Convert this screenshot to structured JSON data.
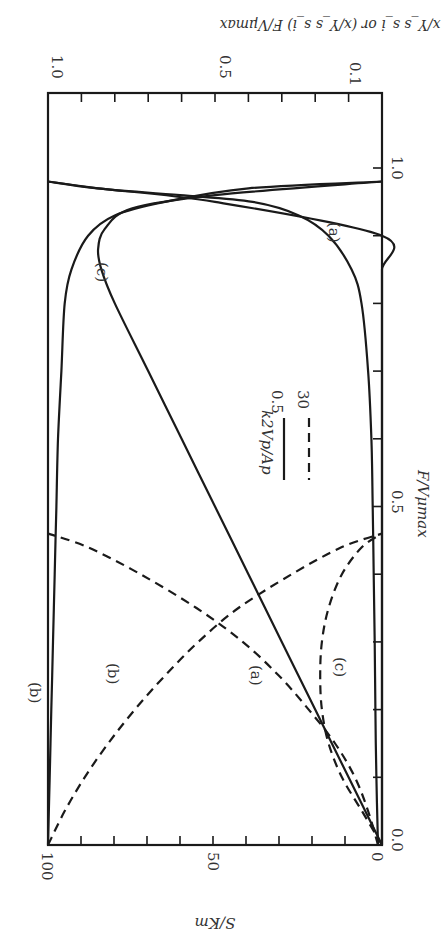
{
  "chart_data": {
    "type": "line",
    "orientation": "figure rotated 90 degrees clockwise on the page",
    "title": "",
    "xlabel": "F/Vμmax",
    "ylabel_left": "S/Km",
    "ylabel_right": "x/Y_s s_i or (x/Y_s s_i) F/Vμmax",
    "xlim": [
      0.0,
      1.0
    ],
    "ylim_left": [
      0,
      100
    ],
    "ylim_right": [
      0.0,
      1.0
    ],
    "x_ticks": [
      "0.0",
      "0.5",
      "1.0"
    ],
    "y_left_ticks": [
      "0",
      "50",
      "100"
    ],
    "y_right_ticks": [
      "0.1",
      "0.5",
      "1.0"
    ],
    "grid": false,
    "legend": {
      "title": "k2Vp/Ap",
      "entries": [
        {
          "label": "0.5",
          "style": "solid"
        },
        {
          "label": "30",
          "style": "dashed"
        }
      ]
    },
    "curve_labels": [
      "(a)",
      "(b)",
      "(c)",
      "(a)",
      "(b)",
      "(c)"
    ],
    "series": [
      {
        "name": "(a) k2Vp/Ap=0.5 — S/Km",
        "style": "solid",
        "axis": "left",
        "x": [
          0.0,
          0.1,
          0.2,
          0.3,
          0.4,
          0.5,
          0.6,
          0.7,
          0.8,
          0.85,
          0.9,
          0.93,
          0.95,
          0.96,
          0.97,
          0.98
        ],
        "y": [
          0.0,
          0.5,
          0.8,
          1.0,
          1.3,
          1.6,
          2.0,
          3.0,
          5.0,
          8.0,
          15.0,
          24.0,
          38.0,
          60.0,
          85.0,
          100.0
        ]
      },
      {
        "name": "(a) k2Vp/Ap=0.5 — biomass",
        "style": "solid",
        "axis": "right",
        "x": [
          0.0,
          0.1,
          0.2,
          0.3,
          0.4,
          0.5,
          0.6,
          0.7,
          0.8,
          0.85,
          0.9,
          0.95,
          0.97,
          0.98
        ],
        "y": [
          0.0,
          0.0,
          0.0,
          0.0,
          0.0,
          0.0,
          0.0,
          0.0,
          0.0,
          0.0,
          0.0,
          0.5,
          0.85,
          1.0
        ]
      },
      {
        "name": "(b) k2Vp/Ap=0.5 — biomass",
        "style": "solid",
        "axis": "right",
        "x": [
          0.0,
          0.1,
          0.2,
          0.3,
          0.4,
          0.5,
          0.6,
          0.7,
          0.8,
          0.85,
          0.9,
          0.93,
          0.95,
          0.97,
          0.98
        ],
        "y": [
          1.0,
          0.995,
          0.99,
          0.985,
          0.98,
          0.975,
          0.97,
          0.96,
          0.95,
          0.93,
          0.88,
          0.8,
          0.65,
          0.4,
          0.0
        ]
      },
      {
        "name": "(c) k2Vp/Ap=0.5 — product",
        "style": "solid",
        "axis": "right",
        "x": [
          0.0,
          0.1,
          0.2,
          0.3,
          0.4,
          0.5,
          0.6,
          0.7,
          0.8,
          0.85,
          0.88,
          0.91,
          0.94,
          0.96,
          0.98
        ],
        "y": [
          0.0,
          0.1,
          0.2,
          0.3,
          0.4,
          0.5,
          0.6,
          0.7,
          0.8,
          0.84,
          0.85,
          0.83,
          0.75,
          0.5,
          0.0
        ]
      },
      {
        "name": "(a) k2Vp/Ap=30 — S/Km",
        "style": "dashed",
        "axis": "left",
        "x": [
          0.0,
          0.05,
          0.1,
          0.15,
          0.2,
          0.25,
          0.3,
          0.35,
          0.4,
          0.44,
          0.46
        ],
        "y": [
          0.0,
          3.0,
          7.0,
          13.0,
          21.0,
          30.0,
          41.0,
          55.0,
          72.0,
          88.0,
          100.0
        ]
      },
      {
        "name": "(b) k2Vp/Ap=30 — biomass",
        "style": "dashed",
        "axis": "right",
        "x": [
          0.0,
          0.05,
          0.1,
          0.15,
          0.2,
          0.25,
          0.3,
          0.35,
          0.4,
          0.44,
          0.46
        ],
        "y": [
          1.0,
          0.95,
          0.89,
          0.82,
          0.74,
          0.65,
          0.55,
          0.43,
          0.27,
          0.12,
          0.0
        ]
      },
      {
        "name": "(c) k2Vp/Ap=30 — product",
        "style": "dashed",
        "axis": "right",
        "x": [
          0.0,
          0.05,
          0.1,
          0.15,
          0.2,
          0.25,
          0.3,
          0.35,
          0.4,
          0.44,
          0.46
        ],
        "y": [
          0.0,
          0.06,
          0.12,
          0.16,
          0.18,
          0.185,
          0.18,
          0.16,
          0.12,
          0.06,
          0.0
        ]
      }
    ]
  }
}
